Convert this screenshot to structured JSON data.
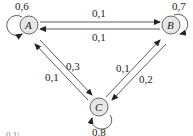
{
  "diagram": {
    "type": "markov-chain",
    "nodes": [
      {
        "id": "A",
        "label": "A",
        "self_loop": "0,6"
      },
      {
        "id": "B",
        "label": "B",
        "self_loop": "0,7"
      },
      {
        "id": "C",
        "label": "C",
        "self_loop": "0,8"
      }
    ],
    "edges": [
      {
        "from": "A",
        "to": "B",
        "label": "0,1"
      },
      {
        "from": "B",
        "to": "A",
        "label": "0,1"
      },
      {
        "from": "A",
        "to": "C",
        "label": "0,3"
      },
      {
        "from": "C",
        "to": "A",
        "label": "0,1"
      },
      {
        "from": "B",
        "to": "C",
        "label": "0,2"
      },
      {
        "from": "C",
        "to": "B",
        "label": "0,1"
      }
    ],
    "fragment_text": "0,1\\"
  }
}
